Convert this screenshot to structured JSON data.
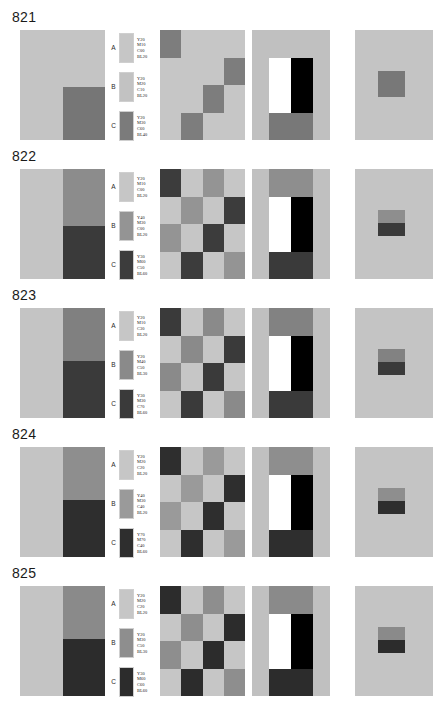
{
  "plate": {
    "title": "Color reproduction plate series 821-825",
    "background": "#ffffff"
  },
  "layout": {
    "block_top": [
      8,
      147,
      286,
      425,
      564
    ],
    "number_top_offset": 2,
    "panel_top_offset": 22,
    "panel_height": 110,
    "panel1": {
      "left": 20,
      "width": 85
    },
    "legend": {
      "left": 108,
      "width": 52
    },
    "checker": {
      "left": 160,
      "width": 85
    },
    "panel4": {
      "left": 252,
      "width": 78
    },
    "panel5": {
      "left": 355,
      "width": 78
    }
  },
  "blocks": [
    {
      "number": "821",
      "legend": [
        {
          "letter": "A",
          "swatch": "#c6c6c6",
          "lines": [
            "Y20",
            "M10",
            "C00",
            "BL20"
          ]
        },
        {
          "letter": "B",
          "swatch": "#c2c2c2",
          "lines": [
            "Y20",
            "M20",
            "C10",
            "BL20"
          ]
        },
        {
          "letter": "C",
          "swatch": "#7b7b7b",
          "lines": [
            "Y20",
            "M30",
            "C60",
            "BL40"
          ]
        }
      ],
      "panel1": {
        "left_color": "#c4c4c4",
        "right_top_color": "#c4c4c4",
        "right_bottom_color": "#767676",
        "right_top_pct": 52,
        "right_bottom_pct": 48
      },
      "checker": [
        "#7d7d7d",
        "#c6c6c6",
        "#c6c6c6",
        "#c6c6c6",
        "#c6c6c6",
        "#c6c6c6",
        "#c6c6c6",
        "#7d7d7d",
        "#c6c6c6",
        "#c6c6c6",
        "#7d7d7d",
        "#c6c6c6",
        "#c6c6c6",
        "#7d7d7d",
        "#c6c6c6",
        "#c6c6c6"
      ],
      "panel4": {
        "surround_color": "#c0c0c0",
        "top_bar_color": "#c0c0c0",
        "bottom_bar_color": "#787878",
        "white_label": "white bar",
        "black_label": "black bar"
      },
      "panel5": {
        "surround_color": "#c4c4c4",
        "patch_top_color": "#787878",
        "patch_bottom_color": "#787878"
      }
    },
    {
      "number": "822",
      "legend": [
        {
          "letter": "A",
          "swatch": "#c6c6c6",
          "lines": [
            "Y20",
            "M10",
            "C00",
            "BL20"
          ]
        },
        {
          "letter": "B",
          "swatch": "#949494",
          "lines": [
            "Y40",
            "M30",
            "C00",
            "BL20"
          ]
        },
        {
          "letter": "C",
          "swatch": "#3c3c3c",
          "lines": [
            "Y30",
            "M60",
            "C50",
            "BL60"
          ]
        }
      ],
      "panel1": {
        "left_color": "#c4c4c4",
        "right_top_color": "#8c8c8c",
        "right_bottom_color": "#3a3a3a",
        "right_top_pct": 52,
        "right_bottom_pct": 48
      },
      "checker": [
        "#3c3c3c",
        "#c6c6c6",
        "#949494",
        "#c6c6c6",
        "#c6c6c6",
        "#949494",
        "#c6c6c6",
        "#3c3c3c",
        "#949494",
        "#c6c6c6",
        "#3c3c3c",
        "#c6c6c6",
        "#c6c6c6",
        "#3c3c3c",
        "#c6c6c6",
        "#949494"
      ],
      "panel4": {
        "surround_color": "#c0c0c0",
        "top_bar_color": "#8e8e8e",
        "bottom_bar_color": "#3a3a3a",
        "white_label": "white bar",
        "black_label": "black bar"
      },
      "panel5": {
        "surround_color": "#c4c4c4",
        "patch_top_color": "#8e8e8e",
        "patch_bottom_color": "#3a3a3a"
      }
    },
    {
      "number": "823",
      "legend": [
        {
          "letter": "A",
          "swatch": "#c6c6c6",
          "lines": [
            "Y20",
            "M10",
            "C30",
            "BL20"
          ]
        },
        {
          "letter": "B",
          "swatch": "#8a8a8a",
          "lines": [
            "Y20",
            "M40",
            "C50",
            "BL30"
          ]
        },
        {
          "letter": "C",
          "swatch": "#3a3a3a",
          "lines": [
            "Y30",
            "M30",
            "C70",
            "BL60"
          ]
        }
      ],
      "panel1": {
        "left_color": "#c4c4c4",
        "right_top_color": "#808080",
        "right_bottom_color": "#3a3a3a",
        "right_top_pct": 48,
        "right_bottom_pct": 52
      },
      "checker": [
        "#3a3a3a",
        "#c6c6c6",
        "#8a8a8a",
        "#c6c6c6",
        "#c6c6c6",
        "#8a8a8a",
        "#c6c6c6",
        "#3a3a3a",
        "#8a8a8a",
        "#c6c6c6",
        "#3a3a3a",
        "#c6c6c6",
        "#c6c6c6",
        "#3a3a3a",
        "#c6c6c6",
        "#8a8a8a"
      ],
      "panel4": {
        "surround_color": "#c0c0c0",
        "top_bar_color": "#828282",
        "bottom_bar_color": "#3a3a3a",
        "white_label": "white bar",
        "black_label": "black bar"
      },
      "panel5": {
        "surround_color": "#c4c4c4",
        "patch_top_color": "#828282",
        "patch_bottom_color": "#3a3a3a"
      }
    },
    {
      "number": "824",
      "legend": [
        {
          "letter": "A",
          "swatch": "#c6c6c6",
          "lines": [
            "Y20",
            "M20",
            "C20",
            "BL20"
          ]
        },
        {
          "letter": "B",
          "swatch": "#9a9a9a",
          "lines": [
            "Y40",
            "M30",
            "C40",
            "BL20"
          ]
        },
        {
          "letter": "C",
          "swatch": "#2e2e2e",
          "lines": [
            "Y70",
            "M70",
            "C40",
            "BL60"
          ]
        }
      ],
      "panel1": {
        "left_color": "#c4c4c4",
        "right_top_color": "#8e8e8e",
        "right_bottom_color": "#2e2e2e",
        "right_top_pct": 48,
        "right_bottom_pct": 52
      },
      "checker": [
        "#2e2e2e",
        "#c6c6c6",
        "#9a9a9a",
        "#c6c6c6",
        "#c6c6c6",
        "#9a9a9a",
        "#c6c6c6",
        "#2e2e2e",
        "#9a9a9a",
        "#c6c6c6",
        "#2e2e2e",
        "#c6c6c6",
        "#c6c6c6",
        "#2e2e2e",
        "#c6c6c6",
        "#9a9a9a"
      ],
      "panel4": {
        "surround_color": "#c0c0c0",
        "top_bar_color": "#8e8e8e",
        "bottom_bar_color": "#2e2e2e",
        "white_label": "white bar",
        "black_label": "black bar"
      },
      "panel5": {
        "surround_color": "#c4c4c4",
        "patch_top_color": "#8e8e8e",
        "patch_bottom_color": "#2e2e2e"
      }
    },
    {
      "number": "825",
      "legend": [
        {
          "letter": "A",
          "swatch": "#c6c6c6",
          "lines": [
            "Y20",
            "M20",
            "C20",
            "BL20"
          ]
        },
        {
          "letter": "B",
          "swatch": "#8e8e8e",
          "lines": [
            "Y20",
            "M30",
            "C50",
            "BL30"
          ]
        },
        {
          "letter": "C",
          "swatch": "#2c2c2c",
          "lines": [
            "Y30",
            "M60",
            "C60",
            "BL60"
          ]
        }
      ],
      "panel1": {
        "left_color": "#c4c4c4",
        "right_top_color": "#8a8a8a",
        "right_bottom_color": "#2c2c2c",
        "right_top_pct": 48,
        "right_bottom_pct": 52
      },
      "checker": [
        "#2c2c2c",
        "#c6c6c6",
        "#8e8e8e",
        "#c6c6c6",
        "#c6c6c6",
        "#8e8e8e",
        "#c6c6c6",
        "#2c2c2c",
        "#8e8e8e",
        "#c6c6c6",
        "#2c2c2c",
        "#c6c6c6",
        "#c6c6c6",
        "#2c2c2c",
        "#c6c6c6",
        "#8e8e8e"
      ],
      "panel4": {
        "surround_color": "#c0c0c0",
        "top_bar_color": "#8a8a8a",
        "bottom_bar_color": "#2c2c2c",
        "white_label": "white bar",
        "black_label": "black bar"
      },
      "panel5": {
        "surround_color": "#c4c4c4",
        "patch_top_color": "#8a8a8a",
        "patch_bottom_color": "#2c2c2c"
      }
    }
  ]
}
